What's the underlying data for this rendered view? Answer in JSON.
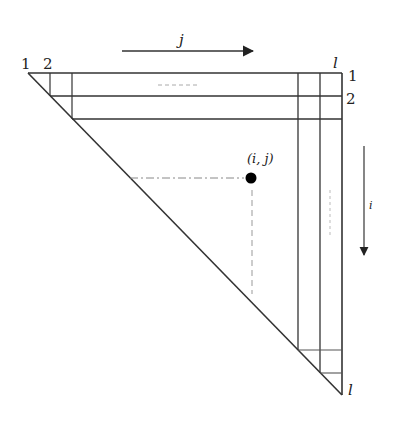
{
  "diagram": {
    "type": "triangular-matrix",
    "colors": {
      "line": "#333333",
      "dashed": "#999999",
      "point": "#000000",
      "background": "#ffffff"
    },
    "axis_j": {
      "label": "j",
      "direction": "right"
    },
    "axis_i": {
      "label": "i",
      "direction": "down"
    },
    "top_labels": {
      "first": "1",
      "second": "2",
      "last": "l"
    },
    "right_labels": {
      "first": "1",
      "second": "2",
      "last": "l"
    },
    "point": {
      "label": "(i, j)"
    }
  }
}
